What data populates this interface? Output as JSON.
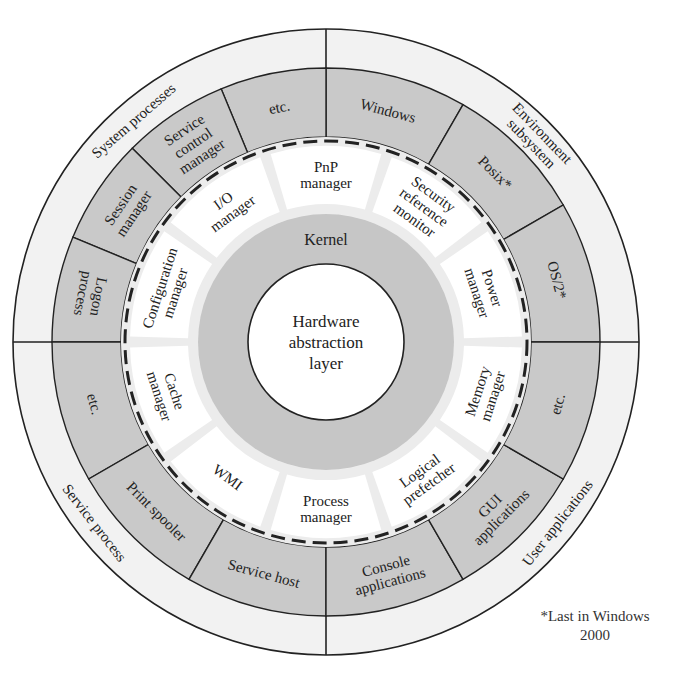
{
  "colors": {
    "outer_ring": "#f2f2f2",
    "gray_ring": "#c9c9c9",
    "module_ring_bg": "#ececec",
    "module_fill": "#ffffff",
    "kernel_ring": "#c6c6c6",
    "hal_fill": "#ffffff",
    "stroke": "#222222"
  },
  "geometry": {
    "cx": 326,
    "cy": 342,
    "r_outer": 313,
    "r_gray_outer": 274,
    "r_gray_inner": 205,
    "r_dashed": 201,
    "r_module_outer": 196,
    "r_module_inner": 138,
    "r_kernel_outer": 128,
    "r_hal": 78
  },
  "outer_groups": [
    {
      "label": "System processes",
      "start": 90,
      "end": 180,
      "text_angle": 131
    },
    {
      "label": "Environment subsystem",
      "start": 0,
      "end": 90,
      "text_angle": 44,
      "multiline": [
        "Environment",
        "subsystem"
      ]
    },
    {
      "label": "Service process",
      "start": 180,
      "end": 270,
      "text_angle": 218
    },
    {
      "label": "User applications",
      "start": 270,
      "end": 360,
      "text_angle": 322
    }
  ],
  "gray_segments": [
    {
      "label": "Windows",
      "lines": [
        "Windows"
      ],
      "start": 60,
      "end": 90
    },
    {
      "label": "Posix*",
      "lines": [
        "Posix*"
      ],
      "start": 30,
      "end": 60
    },
    {
      "label": "OS/2*",
      "lines": [
        "OS/2*"
      ],
      "start": 0,
      "end": 30
    },
    {
      "label": "etc.",
      "lines": [
        "etc."
      ],
      "start": 90,
      "end": 112.5
    },
    {
      "label": "Service control manager",
      "lines": [
        "Service",
        "control",
        "manager"
      ],
      "start": 112.5,
      "end": 135
    },
    {
      "label": "Session manager",
      "lines": [
        "Session",
        "manager"
      ],
      "start": 135,
      "end": 157.5
    },
    {
      "label": "Logon process",
      "lines": [
        "Logon",
        "process"
      ],
      "start": 157.5,
      "end": 180
    },
    {
      "label": "etc.",
      "lines": [
        "etc."
      ],
      "start": 180,
      "end": 210
    },
    {
      "label": "Print spooler",
      "lines": [
        "Print spooler"
      ],
      "start": 210,
      "end": 240
    },
    {
      "label": "Service host",
      "lines": [
        "Service host"
      ],
      "start": 240,
      "end": 270
    },
    {
      "label": "Console applications",
      "lines": [
        "Console",
        "applications"
      ],
      "start": 270,
      "end": 300
    },
    {
      "label": "GUI applications",
      "lines": [
        "GUI",
        "applications"
      ],
      "start": 300,
      "end": 330
    },
    {
      "label": "etc.",
      "lines": [
        "etc."
      ],
      "start": 330,
      "end": 360
    }
  ],
  "executive_modules": [
    {
      "label": "Power manager",
      "lines": [
        "Power",
        "manager"
      ],
      "start": 0,
      "end": 36
    },
    {
      "label": "Security reference monitor",
      "lines": [
        "Security",
        "reference",
        "monitor"
      ],
      "start": 36,
      "end": 72
    },
    {
      "label": "PnP manager",
      "lines": [
        "PnP",
        "manager"
      ],
      "start": 72,
      "end": 108
    },
    {
      "label": "I/O manager",
      "lines": [
        "I/O",
        "manager"
      ],
      "start": 108,
      "end": 144
    },
    {
      "label": "Configuration manager",
      "lines": [
        "Configuration",
        "manager"
      ],
      "start": 144,
      "end": 180
    },
    {
      "label": "Cache manager",
      "lines": [
        "Cache",
        "manager"
      ],
      "start": 180,
      "end": 216
    },
    {
      "label": "WMI",
      "lines": [
        "WMI"
      ],
      "start": 216,
      "end": 252
    },
    {
      "label": "Process manager",
      "lines": [
        "Process",
        "manager"
      ],
      "start": 252,
      "end": 288
    },
    {
      "label": "Logical prefetcher",
      "lines": [
        "Logical",
        "prefetcher"
      ],
      "start": 288,
      "end": 324
    },
    {
      "label": "Memory manager",
      "lines": [
        "Memory",
        "manager"
      ],
      "start": 324,
      "end": 360
    }
  ],
  "kernel": {
    "label": "Kernel"
  },
  "hal": {
    "label": "Hardware abstraction layer",
    "lines": [
      "Hardware",
      "abstraction",
      "layer"
    ]
  },
  "footnote": {
    "line1": "*Last in Windows",
    "line2": "2000"
  }
}
